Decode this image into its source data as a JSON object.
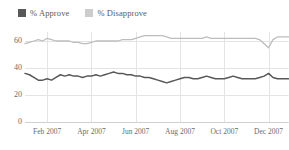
{
  "chart_data": {
    "type": "line",
    "title": "",
    "subtitle": "",
    "xlabel": "",
    "ylabel": "",
    "ylim": [
      0,
      70
    ],
    "yticks": [
      0,
      20,
      40,
      60
    ],
    "ytick_labels": [
      "0",
      "20",
      "40",
      "60"
    ],
    "grid": true,
    "legend_position": "top-left",
    "xtick_labels": [
      "Feb 2007",
      "Apr 2007",
      "Jun 2007",
      "Aug 2007",
      "Oct 2007",
      "Dec 2007"
    ],
    "xtick_positions": [
      2,
      4,
      6,
      8,
      10,
      12
    ],
    "x_range": [
      1,
      12.9
    ],
    "x": [
      1.0,
      1.2,
      1.4,
      1.6,
      1.8,
      2.0,
      2.2,
      2.4,
      2.6,
      2.8,
      3.0,
      3.2,
      3.4,
      3.6,
      3.8,
      4.0,
      4.2,
      4.4,
      4.6,
      4.8,
      5.0,
      5.2,
      5.4,
      5.6,
      5.8,
      6.0,
      6.2,
      6.4,
      6.6,
      6.8,
      7.0,
      7.2,
      7.4,
      7.6,
      7.8,
      8.0,
      8.2,
      8.4,
      8.6,
      8.8,
      9.0,
      9.2,
      9.4,
      9.6,
      9.8,
      10.0,
      10.2,
      10.4,
      10.6,
      10.8,
      11.0,
      11.2,
      11.4,
      11.6,
      11.8,
      12.0,
      12.2,
      12.4,
      12.6,
      12.9
    ],
    "series": [
      {
        "name": "% Approve",
        "color": "#585858",
        "values": [
          36,
          35,
          33,
          31,
          31,
          32,
          31,
          33,
          35,
          34,
          35,
          34,
          34,
          33,
          34,
          34,
          35,
          34,
          35,
          36,
          37,
          36,
          36,
          35,
          35,
          34,
          34,
          33,
          33,
          32,
          31,
          30,
          29,
          30,
          31,
          32,
          33,
          33,
          32,
          32,
          33,
          34,
          33,
          32,
          32,
          32,
          33,
          34,
          33,
          32,
          32,
          32,
          32,
          33,
          34,
          36,
          33,
          32,
          32,
          32
        ]
      },
      {
        "name": "% Disapprove",
        "color": "#bdbdbd",
        "values": [
          58,
          59,
          60,
          61,
          60,
          62,
          61,
          60,
          60,
          60,
          60,
          59,
          59,
          58,
          58,
          59,
          60,
          60,
          60,
          60,
          60,
          60,
          61,
          61,
          61,
          62,
          63,
          64,
          64,
          64,
          64,
          64,
          63,
          62,
          62,
          62,
          62,
          62,
          62,
          62,
          62,
          63,
          62,
          62,
          62,
          62,
          62,
          62,
          62,
          62,
          62,
          62,
          62,
          61,
          58,
          55,
          61,
          63,
          63,
          63
        ]
      }
    ]
  },
  "legend": {
    "entries": [
      {
        "label": "% Approve",
        "color": "#585858"
      },
      {
        "label": "% Disapprove",
        "color": "#cccccc"
      }
    ]
  },
  "colors": {
    "background": "#ffffff",
    "grid": "#e4e4e4",
    "axis": "#d0d0d0",
    "text": "#6b6b6b",
    "approve": "#585858",
    "disapprove": "#bdbdbd"
  }
}
